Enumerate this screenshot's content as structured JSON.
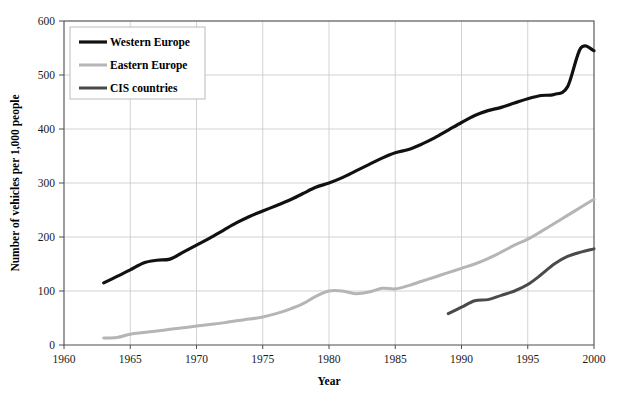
{
  "chart_data": {
    "type": "line",
    "title": "",
    "xlabel": "Year",
    "ylabel": "Number of vehicles per 1,000 people",
    "xlim": [
      1960,
      2000
    ],
    "ylim": [
      0,
      600
    ],
    "xticks": [
      "1960",
      "1965",
      "1970",
      "1975",
      "1980",
      "1985",
      "1990",
      "1995",
      "2000"
    ],
    "yticks": [
      "0",
      "100",
      "200",
      "300",
      "400",
      "500",
      "600"
    ],
    "grid": true,
    "legend_position": "top-left",
    "series": [
      {
        "name": "Western Europe",
        "color": "#111111",
        "width": 3.2,
        "x": [
          1963,
          1964,
          1965,
          1966,
          1967,
          1968,
          1969,
          1970,
          1971,
          1972,
          1973,
          1974,
          1975,
          1976,
          1977,
          1978,
          1979,
          1980,
          1981,
          1982,
          1983,
          1984,
          1985,
          1986,
          1987,
          1988,
          1989,
          1990,
          1991,
          1992,
          1993,
          1994,
          1995,
          1996,
          1997,
          1998,
          1999,
          2000
        ],
        "values": [
          115,
          127,
          139,
          152,
          157,
          159,
          172,
          185,
          198,
          212,
          226,
          238,
          248,
          258,
          268,
          280,
          292,
          300,
          310,
          322,
          334,
          346,
          356,
          362,
          372,
          384,
          398,
          412,
          425,
          434,
          440,
          448,
          456,
          462,
          464,
          478,
          550,
          545
        ]
      },
      {
        "name": "Eastern Europe",
        "color": "#b5b5b5",
        "width": 3.0,
        "x": [
          1963,
          1964,
          1965,
          1966,
          1967,
          1968,
          1969,
          1970,
          1971,
          1972,
          1973,
          1974,
          1975,
          1976,
          1977,
          1978,
          1979,
          1980,
          1981,
          1982,
          1983,
          1984,
          1985,
          1986,
          1987,
          1988,
          1989,
          1990,
          1991,
          1992,
          1993,
          1994,
          1995,
          1996,
          1997,
          1998,
          1999,
          2000
        ],
        "values": [
          13,
          14,
          20,
          23,
          26,
          29,
          32,
          35,
          38,
          41,
          45,
          48,
          52,
          58,
          66,
          76,
          90,
          100,
          100,
          95,
          98,
          105,
          104,
          110,
          118,
          126,
          134,
          142,
          150,
          160,
          172,
          185,
          196,
          210,
          225,
          240,
          255,
          270
        ]
      },
      {
        "name": "CIS countries",
        "color": "#4a4a4a",
        "width": 3.0,
        "x": [
          1989,
          1990,
          1991,
          1992,
          1993,
          1994,
          1995,
          1996,
          1997,
          1998,
          1999,
          2000
        ],
        "values": [
          58,
          70,
          82,
          84,
          92,
          100,
          112,
          130,
          150,
          164,
          172,
          178
        ]
      }
    ]
  },
  "legend": {
    "items": [
      {
        "label": "Western Europe"
      },
      {
        "label": "Eastern Europe"
      },
      {
        "label": "CIS countries"
      }
    ]
  },
  "axes": {
    "x_title": "Year",
    "y_title": "Number of vehicles per 1,000 people"
  }
}
